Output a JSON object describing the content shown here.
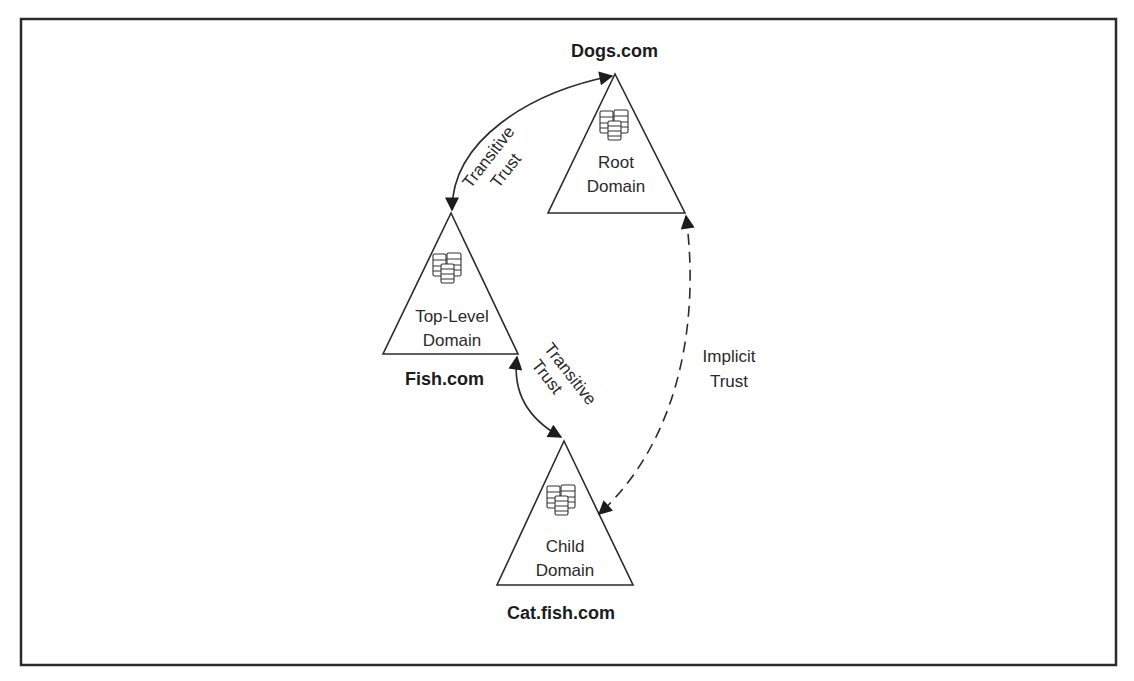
{
  "figure": {
    "frame": {
      "x": 21,
      "y": 19,
      "width": 1095,
      "height": 646
    },
    "colors": {
      "line": "#2b2b2b",
      "text": "#222222",
      "background": "#ffffff"
    }
  },
  "nodes": {
    "root": {
      "domain_name": "Dogs.com",
      "line1": "Root",
      "line2": "Domain",
      "icon": "server-cluster-icon"
    },
    "top_level": {
      "domain_name": "Fish.com",
      "line1": "Top-Level",
      "line2": "Domain",
      "icon": "server-cluster-icon"
    },
    "child": {
      "domain_name": "Cat.fish.com",
      "line1": "Child",
      "line2": "Domain",
      "icon": "server-cluster-icon"
    }
  },
  "edges": {
    "root_to_top": {
      "line1": "Transitive",
      "line2": "Trust",
      "style": "solid",
      "arrows": "both"
    },
    "top_to_child": {
      "line1": "Transitive",
      "line2": "Trust",
      "style": "solid",
      "arrows": "both"
    },
    "root_to_child": {
      "line1": "Implicit",
      "line2": "Trust",
      "style": "dashed",
      "arrows": "both"
    }
  }
}
